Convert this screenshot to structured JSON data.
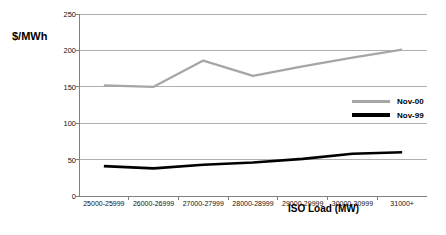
{
  "chart_data": {
    "type": "line",
    "title": "",
    "xlabel": "ISO Load (MW)",
    "ylabel": "$/MWh",
    "categories": [
      "25000-25999",
      "26000-26999",
      "27000-27999",
      "28000-28999",
      "29000-29999",
      "30000-30999",
      "31000+"
    ],
    "series": [
      {
        "name": "Nov-00",
        "color": "#a6a6a6",
        "values": [
          152,
          150,
          186,
          165,
          178,
          190,
          201
        ]
      },
      {
        "name": "Nov-99",
        "color": "#000000",
        "values": [
          41,
          38,
          43,
          46,
          51,
          58,
          60
        ]
      }
    ],
    "ylim": [
      0,
      250
    ],
    "yticks": [
      "0",
      "50",
      "100",
      "150",
      "200",
      "250"
    ],
    "ytick_values": [
      0,
      50,
      100,
      150,
      200,
      250
    ],
    "grid": true,
    "legend_position": "inside-right"
  },
  "axes": {
    "y_title": "$/MWh",
    "x_title": "ISO Load (MW)"
  },
  "legend": {
    "entries": [
      {
        "label": "Nov-00",
        "color": "#a6a6a6"
      },
      {
        "label": "Nov-99",
        "color": "#000000"
      }
    ]
  },
  "colors": {
    "series_nov00": "#a6a6a6",
    "series_nov99": "#000000",
    "grid": "#b0b0b0",
    "axis": "#808080",
    "text": "#111111",
    "background": "#ffffff"
  }
}
